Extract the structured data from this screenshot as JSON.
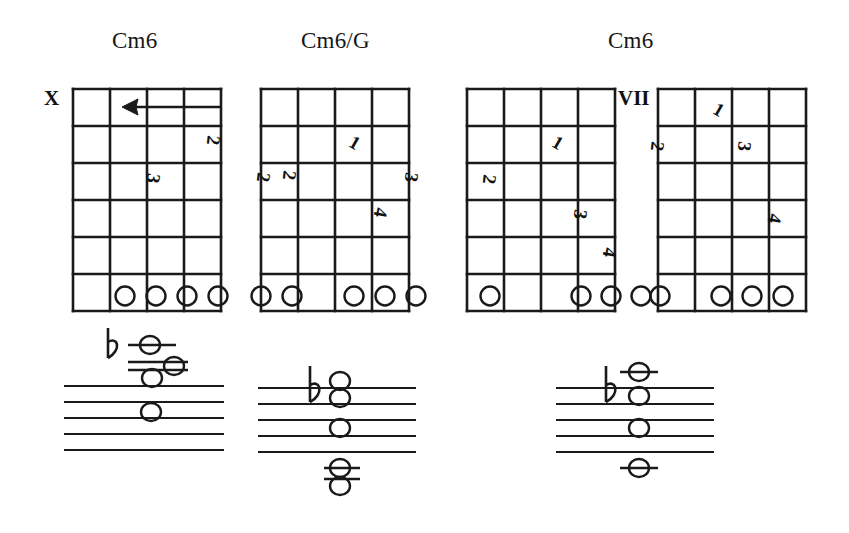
{
  "page": {
    "background_color": "#ffffff",
    "ink_color": "#161616",
    "width": 849,
    "height": 533
  },
  "titles": [
    {
      "name": "chord-title-1",
      "label": "Cm6",
      "x": 112,
      "y": 28
    },
    {
      "name": "chord-title-2",
      "label": "Cm6/G",
      "x": 301,
      "y": 28
    },
    {
      "name": "chord-title-3",
      "label": "Cm6",
      "x": 608,
      "y": 28
    }
  ],
  "diagrams": [
    {
      "id": "chord-diagram-1",
      "chord": "Cm6",
      "x": 72,
      "y": 88,
      "width": 148,
      "height": 222,
      "strings": 5,
      "frets": 6,
      "position_marker": {
        "label": "X",
        "x": 44,
        "y": 88
      },
      "barre": {
        "present": true,
        "fret": 1,
        "from_string": 5,
        "to_string": 2,
        "direction": "left"
      },
      "fingerings": [
        {
          "finger": "2",
          "x": 207,
          "y": 140
        },
        {
          "finger": "3",
          "x": 148,
          "y": 172
        }
      ],
      "open_circles": [
        {
          "string_index": 2,
          "cx": 125,
          "cy": 297
        },
        {
          "string_index": 3,
          "cx": 156,
          "cy": 297
        },
        {
          "string_index": 4,
          "cx": 188,
          "cy": 297
        },
        {
          "string_index": 5,
          "cx": 219,
          "cy": 297
        }
      ]
    },
    {
      "id": "chord-diagram-2",
      "chord": "Cm6/G",
      "x": 260,
      "y": 88,
      "width": 148,
      "height": 222,
      "strings": 5,
      "frets": 6,
      "position_marker": {
        "label": "",
        "x": 0,
        "y": 0
      },
      "barre": {
        "present": false
      },
      "fingerings": [
        {
          "finger": "1",
          "x": 348,
          "y": 138
        },
        {
          "finger": "2",
          "x": 262,
          "y": 170
        },
        {
          "finger": "2",
          "x": 286,
          "y": 170
        },
        {
          "finger": "3",
          "x": 408,
          "y": 170
        },
        {
          "finger": "4",
          "x": 378,
          "y": 205
        }
      ],
      "open_circles": [
        {
          "string_index": 0,
          "cx": 262,
          "cy": 297
        },
        {
          "string_index": 1,
          "cx": 293,
          "cy": 297
        },
        {
          "string_index": 3,
          "cx": 355,
          "cy": 297
        },
        {
          "string_index": 4,
          "cx": 386,
          "cy": 297
        },
        {
          "string_index": 5,
          "cx": 417,
          "cy": 297
        }
      ]
    },
    {
      "id": "chord-diagram-3",
      "chord": "Cm6",
      "x": 466,
      "y": 88,
      "width": 148,
      "height": 222,
      "strings": 5,
      "frets": 6,
      "position_marker": {
        "label": "",
        "x": 0,
        "y": 0
      },
      "barre": {
        "present": false
      },
      "fingerings": [
        {
          "finger": "1",
          "x": 551,
          "y": 138
        },
        {
          "finger": "2",
          "x": 487,
          "y": 172
        },
        {
          "finger": "3",
          "x": 578,
          "y": 208
        },
        {
          "finger": "4",
          "x": 607,
          "y": 246
        }
      ],
      "open_circles": [
        {
          "string_index": 0,
          "cx": 490,
          "cy": 297
        },
        {
          "string_index": 2,
          "cx": 581,
          "cy": 297
        },
        {
          "string_index": 3,
          "cx": 611,
          "cy": 297
        },
        {
          "string_index": 4,
          "cx": 641,
          "cy": 297
        }
      ]
    },
    {
      "id": "chord-diagram-4",
      "chord": "Cm6",
      "x": 657,
      "y": 88,
      "width": 148,
      "height": 222,
      "strings": 5,
      "frets": 6,
      "position_marker": {
        "label": "VII",
        "x": 623,
        "y": 88
      },
      "barre": {
        "present": false
      },
      "fingerings": [
        {
          "finger": "1",
          "x": 712,
          "y": 104
        },
        {
          "finger": "2",
          "x": 655,
          "y": 140
        },
        {
          "finger": "3",
          "x": 742,
          "y": 140
        },
        {
          "finger": "4",
          "x": 772,
          "y": 212
        }
      ],
      "open_circles": [
        {
          "string_index": 0,
          "cx": 660,
          "cy": 297
        },
        {
          "string_index": 2,
          "cx": 721,
          "cy": 297
        },
        {
          "string_index": 3,
          "cx": 752,
          "cy": 297
        },
        {
          "string_index": 4,
          "cx": 783,
          "cy": 297
        }
      ]
    }
  ],
  "staves": [
    {
      "id": "staff-1",
      "x": 64,
      "y": 386,
      "width": 158,
      "line_gap": 16,
      "lines": 5,
      "accidentals": [
        {
          "symbol": "flat",
          "x": 112,
          "y": 336
        }
      ],
      "ledger_lines": [
        {
          "x1": 128,
          "x2": 176,
          "y": 345
        },
        {
          "x1": 128,
          "x2": 186,
          "y": 362
        },
        {
          "x1": 128,
          "x2": 186,
          "y": 370
        }
      ],
      "notes": [
        {
          "cx": 149,
          "cy": 345
        },
        {
          "cx": 173,
          "cy": 366
        },
        {
          "cx": 152,
          "cy": 378
        },
        {
          "cx": 150,
          "cy": 414
        }
      ]
    },
    {
      "id": "staff-2",
      "x": 258,
      "y": 388,
      "width": 158,
      "line_gap": 16,
      "lines": 5,
      "accidentals": [
        {
          "symbol": "flat",
          "x": 306,
          "y": 374
        }
      ],
      "stems": [
        {
          "x": 306,
          "y1": 366,
          "y2": 400
        }
      ],
      "ledger_lines": [
        {
          "x1": 318,
          "x2": 358,
          "y": 458
        },
        {
          "x1": 318,
          "x2": 358,
          "y": 474
        }
      ],
      "notes": [
        {
          "cx": 338,
          "cy": 388
        },
        {
          "cx": 338,
          "cy": 400
        },
        {
          "cx": 338,
          "cy": 428
        },
        {
          "cx": 338,
          "cy": 466
        },
        {
          "cx": 338,
          "cy": 482
        }
      ]
    },
    {
      "id": "staff-3",
      "x": 556,
      "y": 388,
      "width": 158,
      "line_gap": 16,
      "lines": 5,
      "accidentals": [
        {
          "symbol": "flat",
          "x": 604,
          "y": 374
        }
      ],
      "stems": [
        {
          "x": 604,
          "y1": 366,
          "y2": 400
        }
      ],
      "ledger_lines": [
        {
          "x1": 618,
          "x2": 656,
          "y": 372
        },
        {
          "x1": 618,
          "x2": 656,
          "y": 468
        }
      ],
      "notes": [
        {
          "cx": 637,
          "cy": 372
        },
        {
          "cx": 637,
          "cy": 396
        },
        {
          "cx": 637,
          "cy": 428
        },
        {
          "cx": 637,
          "cy": 468
        }
      ]
    }
  ],
  "legend": {
    "open_circle_meaning": "open / fretted string marker",
    "x_meaning": "string not played",
    "roman_numeral_meaning": "fret position"
  }
}
